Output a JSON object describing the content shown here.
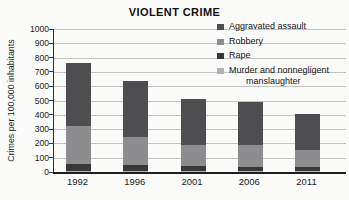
{
  "chart_data": {
    "type": "bar",
    "stacked": true,
    "title": "VIOLENT CRIME",
    "ylabel": "Crimes per 100,000 inhabitants",
    "xlabel": "",
    "categories": [
      "1992",
      "1996",
      "2001",
      "2006",
      "2011"
    ],
    "series": [
      {
        "name": "Aggravated assault",
        "color": "#4e4e50",
        "values": [
          440,
          390,
          320,
          300,
          250
        ],
        "legend_lines": [
          "Aggravated assault"
        ]
      },
      {
        "name": "Robbery",
        "color": "#8d8d90",
        "values": [
          265,
          200,
          150,
          150,
          120
        ],
        "legend_lines": [
          "Robbery"
        ]
      },
      {
        "name": "Rape",
        "color": "#38383a",
        "values": [
          45,
          38,
          33,
          32,
          28
        ],
        "legend_lines": [
          "Rape"
        ]
      },
      {
        "name": "Murder and nonnegligent manslaughter",
        "color": "#b3b3b5",
        "values": [
          10,
          8,
          7,
          6,
          5
        ],
        "legend_lines": [
          "Murder and nonnegligent",
          "manslaughter"
        ]
      }
    ],
    "ylim": [
      0,
      1000
    ],
    "ytick_step": 100,
    "grid": true,
    "legend_position": "top-right",
    "axis_color": "#2f2f2f",
    "grid_color": "#c4c4c3"
  }
}
